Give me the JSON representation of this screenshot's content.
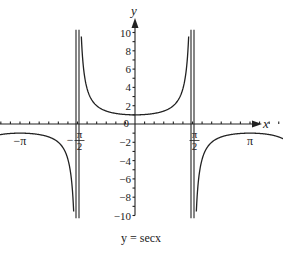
{
  "chart_data": {
    "type": "line",
    "title": "y = secx",
    "xlabel": "x",
    "ylabel": "y",
    "function": "sec(x)",
    "xlim": [
      -5.7,
      5.9
    ],
    "ylim": [
      -10,
      10
    ],
    "y_ticks": [
      -10,
      -8,
      -6,
      -4,
      -2,
      0,
      2,
      4,
      6,
      8,
      10
    ],
    "y_tick_labels": [
      "−10",
      "−8",
      "−6",
      "−4",
      "−2",
      "0",
      "2",
      "4",
      "6",
      "8",
      "10"
    ],
    "x_tick_labels": [
      {
        "value": -4.712,
        "num": "−3π",
        "den": "2"
      },
      {
        "value": -3.1416,
        "label": "−π"
      },
      {
        "value": -1.5708,
        "num": "−π",
        "den": "2"
      },
      {
        "value": 1.5708,
        "num": "π",
        "den": "2"
      },
      {
        "value": 3.1416,
        "label": "π"
      },
      {
        "value": 4.712,
        "num": "3π",
        "den": "2"
      }
    ],
    "asymptotes": [
      -4.712,
      -1.5708,
      1.5708,
      4.712
    ],
    "grid": false,
    "legend": null
  },
  "caption": "y = secx",
  "axis_labels": {
    "x": "x",
    "y": "y"
  }
}
